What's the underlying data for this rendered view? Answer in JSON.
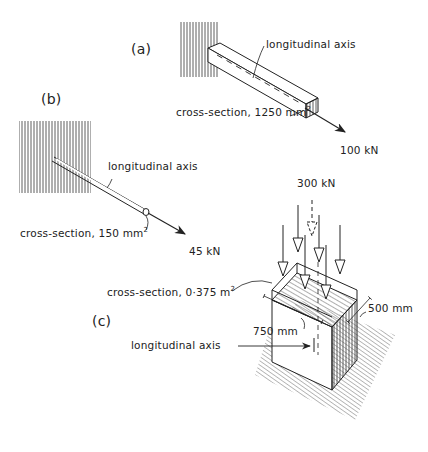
{
  "figure": {
    "panels": [
      {
        "id": "a",
        "label": "(a)",
        "member": "square bar in tension",
        "axis_label": "longitudinal axis",
        "cross_section_label": "cross-section, 1250 mm",
        "cross_section_exp": "2",
        "force_label": "100 kN"
      },
      {
        "id": "b",
        "label": "(b)",
        "member": "thin rod in tension",
        "axis_label": "longitudinal axis",
        "cross_section_label": "cross-section, 150 mm",
        "cross_section_exp": "2",
        "force_label": "45 kN"
      },
      {
        "id": "c",
        "label": "(c)",
        "member": "short block in compression",
        "axis_label": "longitudinal axis",
        "cross_section_label": "cross-section, 0·375 m",
        "cross_section_exp": "2",
        "force_label": "300 kN",
        "dim_width": "750 mm",
        "dim_depth": "500 mm"
      }
    ],
    "colors": {
      "ink": "#222222",
      "background": "#ffffff"
    }
  }
}
